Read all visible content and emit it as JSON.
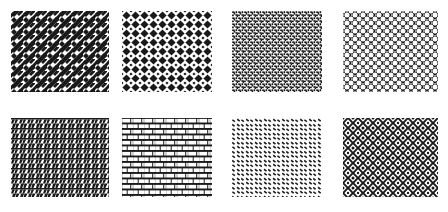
{
  "page": {
    "background_color": "#ffffff",
    "ink_color": "#1a1a1a",
    "width": 448,
    "height": 212,
    "columns": 4,
    "rows": 2
  },
  "swatches": [
    {
      "index": 1,
      "name": "basketweave-diagonal",
      "label": "Basketweave Diagonal",
      "position": {
        "row": 0,
        "col": 0
      },
      "box": {
        "x": 11,
        "y": 11,
        "w": 98,
        "h": 81
      },
      "fill": "#1a1a1a",
      "ground": "#ffffff",
      "tile": 12,
      "density": "dense",
      "description": "Interlocking diagonal bars forming a woven lattice"
    },
    {
      "index": 2,
      "name": "diamond-checker",
      "label": "Diamond Checker",
      "position": {
        "row": 0,
        "col": 1
      },
      "box": {
        "x": 122,
        "y": 11,
        "w": 90,
        "h": 81
      },
      "fill": "#1a1a1a",
      "ground": "#ffffff",
      "tile": 9,
      "density": "medium",
      "description": "Rounded diamonds on a regular square grid"
    },
    {
      "index": 3,
      "name": "step-dash-dense",
      "label": "Step Dash Dense",
      "position": {
        "row": 0,
        "col": 2
      },
      "box": {
        "x": 232,
        "y": 11,
        "w": 90,
        "h": 81
      },
      "fill": "#1a1a1a",
      "ground": "#ffffff",
      "tile": 6,
      "density": "dense",
      "description": "Tiny staggered L-shaped dashes packed edge to edge"
    },
    {
      "index": 4,
      "name": "dark-dot-grid",
      "label": "Dark Dot Grid",
      "position": {
        "row": 0,
        "col": 3
      },
      "box": {
        "x": 343,
        "y": 11,
        "w": 95,
        "h": 81
      },
      "fill": "#1a1a1a",
      "ground": "#ffffff",
      "tile": 8,
      "density": "very-dense",
      "description": "Solid dark field punctured by white round holes"
    },
    {
      "index": 5,
      "name": "zigzag-rows",
      "label": "Zigzag Rows",
      "position": {
        "row": 1,
        "col": 0
      },
      "box": {
        "x": 11,
        "y": 118,
        "w": 98,
        "h": 79
      },
      "fill": "#1a1a1a",
      "ground": "#ffffff",
      "tile": 10,
      "density": "medium",
      "description": "Horizontal rules with diagonal lightning strokes"
    },
    {
      "index": 6,
      "name": "running-bond-brick",
      "label": "Running Bond Brick",
      "position": {
        "row": 1,
        "col": 1
      },
      "box": {
        "x": 122,
        "y": 118,
        "w": 90,
        "h": 79
      },
      "fill": "#1a1a1a",
      "ground": "#ffffff",
      "tile": 10,
      "density": "medium",
      "description": "Offset brick courses with dark mortar joints"
    },
    {
      "index": 7,
      "name": "sparse-diagonal-dash",
      "label": "Sparse Diagonal Dash",
      "position": {
        "row": 1,
        "col": 2
      },
      "box": {
        "x": 232,
        "y": 118,
        "w": 90,
        "h": 79
      },
      "fill": "#1a1a1a",
      "ground": "#ffffff",
      "tile": 9,
      "density": "sparse",
      "description": "Short diagonal dashes scattered on a staggered grid"
    },
    {
      "index": 8,
      "name": "chainlink-mesh",
      "label": "Chainlink Mesh",
      "position": {
        "row": 1,
        "col": 3
      },
      "box": {
        "x": 343,
        "y": 118,
        "w": 95,
        "h": 79
      },
      "fill": "#1a1a1a",
      "ground": "#ffffff",
      "tile": 10,
      "density": "very-dense",
      "description": "Dark mesh of linked rings leaving white diamond holes"
    }
  ]
}
